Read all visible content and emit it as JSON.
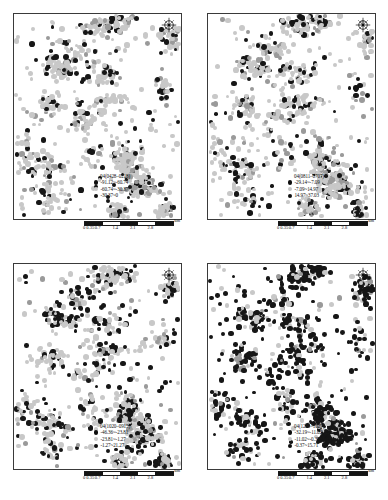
{
  "figure": {
    "type": "four-panel-point-map-grid",
    "panel_count": 4,
    "background": "#ffffff"
  },
  "scalebar": {
    "ticks": [
      "0",
      "0.35",
      "0.7",
      "1.4",
      "2.1",
      "2.8"
    ],
    "unit_label": "km",
    "segments": [
      "black",
      "white",
      "black",
      "white",
      "black"
    ]
  },
  "icons": {
    "compass": "north-arrow-compass-icon"
  },
  "colors": {
    "dark_point": "#161616",
    "light_point": "#c8c8c8",
    "mid_point": "#9a9a9a",
    "frame": "#3a3a3a",
    "text": "#101010"
  },
  "panels": [
    {
      "id": "panel-top-left",
      "position": "top-left",
      "legend": {
        "title": "04(0428–0218)",
        "entries": [
          {
            "symbol": "dark",
            "label": "-91.12~-60.74"
          },
          {
            "symbol": "light",
            "label": "-60.74~-30.37"
          },
          {
            "symbol": "dark",
            "label": "-30.37~0"
          }
        ]
      }
    },
    {
      "id": "panel-top-right",
      "position": "top-right",
      "legend": {
        "title": "04(0811–0707)",
        "entries": [
          {
            "symbol": "dark",
            "label": "-29.14~-7.09"
          },
          {
            "symbol": "light",
            "label": "-7.09~14.97"
          },
          {
            "symbol": "dark",
            "label": "14.97~37.03"
          }
        ]
      }
    },
    {
      "id": "panel-bottom-left",
      "position": "bottom-left",
      "legend": {
        "title": "04(1020–0915)",
        "entries": [
          {
            "symbol": "dark",
            "label": "-46.36~-23.81"
          },
          {
            "symbol": "light",
            "label": "-23.81~-1.27"
          },
          {
            "symbol": "dark",
            "label": "-1.27~21.27"
          }
        ]
      }
    },
    {
      "id": "panel-bottom-right",
      "position": "bottom-right",
      "legend": {
        "title": "04(1229–1025)",
        "entries": [
          {
            "symbol": "dark",
            "label": "-32.19~-11.02"
          },
          {
            "symbol": "light",
            "label": "-11.02~-0.37"
          },
          {
            "symbol": "dark",
            "label": "-0.37~15.71"
          }
        ]
      }
    }
  ],
  "chart_data": {
    "type": "scatter",
    "title": "",
    "xlabel": "",
    "ylabel": "",
    "legend_position": "bottom-right-inside",
    "grid": false,
    "note": "Four spatial scatter maps of clustered point features; marker shade encodes the value class given in each panel legend. Dark-point density increases markedly in the bottom-right panel.",
    "panel_dark_fraction": [
      0.22,
      0.24,
      0.33,
      0.72
    ]
  }
}
